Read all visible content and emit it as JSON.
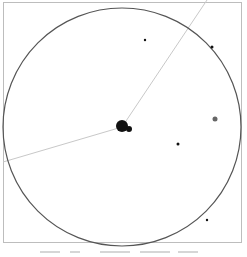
{
  "diagram": {
    "type": "star-field-fov",
    "colors": {
      "frame": "#bdbdbd",
      "circle": "#555555",
      "trail": "#c8c8c8",
      "object": "#111111",
      "faint_object": "#666666",
      "caption": "#d6d6d6"
    },
    "circle": {
      "cx": 122,
      "cy": 127,
      "r": 119
    },
    "trail": {
      "points": [
        [
          207,
          0
        ],
        [
          122,
          127
        ],
        [
          3,
          162
        ]
      ]
    },
    "objects": [
      {
        "name": "primary-body",
        "cx": 122,
        "cy": 126,
        "r": 6
      },
      {
        "name": "companion-body",
        "cx": 129,
        "cy": 129,
        "r": 3
      },
      {
        "name": "dot-right",
        "cx": 215,
        "cy": 119,
        "r": 2.5,
        "faint": true
      },
      {
        "name": "dot-mid-right",
        "cx": 178,
        "cy": 144,
        "r": 1.5
      },
      {
        "name": "dot-top",
        "cx": 145,
        "cy": 40,
        "r": 1.2
      },
      {
        "name": "dot-top-right",
        "cx": 212,
        "cy": 47,
        "r": 1.5
      },
      {
        "name": "dot-bottom-right",
        "cx": 207,
        "cy": 220,
        "r": 1.2
      }
    ],
    "caption_marks": [
      [
        40,
        20
      ],
      [
        70,
        10
      ],
      [
        100,
        30
      ],
      [
        140,
        30
      ],
      [
        178,
        20
      ]
    ]
  }
}
